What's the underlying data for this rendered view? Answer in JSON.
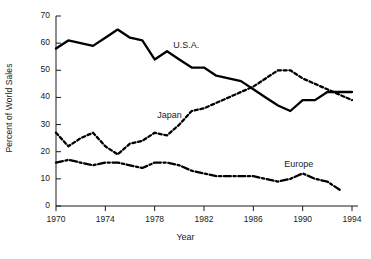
{
  "chart_data": {
    "type": "line",
    "title": "",
    "xlabel": "Year",
    "ylabel": "Percent of World Sales",
    "xlim": [
      1970,
      1994
    ],
    "ylim": [
      0,
      70
    ],
    "xticks": [
      1970,
      1974,
      1978,
      1982,
      1986,
      1990,
      1994
    ],
    "yticks": [
      0,
      10,
      20,
      30,
      40,
      50,
      60,
      70
    ],
    "grid": false,
    "legend_position": "inline-annotations",
    "x": [
      1970,
      1971,
      1972,
      1973,
      1974,
      1975,
      1976,
      1977,
      1978,
      1979,
      1980,
      1981,
      1982,
      1983,
      1984,
      1985,
      1986,
      1987,
      1988,
      1989,
      1990,
      1991,
      1992,
      1993,
      1994
    ],
    "series": [
      {
        "name": "U.S.A.",
        "style": "solid",
        "color": "#000000",
        "values": [
          58,
          61,
          60,
          59,
          62,
          65,
          62,
          61,
          54,
          57,
          54,
          51,
          51,
          48,
          47,
          46,
          43,
          40,
          37,
          35,
          39,
          39,
          42,
          42,
          42
        ]
      },
      {
        "name": "Japan",
        "style": "dotted",
        "color": "#000000",
        "values": [
          27,
          22,
          25,
          27,
          22,
          19,
          23,
          24,
          27,
          26,
          30,
          35,
          36,
          38,
          40,
          42,
          44,
          47,
          50,
          50,
          47,
          45,
          43,
          41,
          39
        ]
      },
      {
        "name": "Europe",
        "style": "dash-dot",
        "color": "#000000",
        "values": [
          16,
          17,
          16,
          15,
          16,
          16,
          15,
          14,
          16,
          16,
          15,
          13,
          12,
          11,
          11,
          11,
          11,
          10,
          9,
          10,
          12,
          10,
          9,
          6,
          null
        ]
      }
    ],
    "annotations": [
      {
        "text": "U.S.A.",
        "x": 1979.5,
        "y": 59
      },
      {
        "text": "Japan",
        "x": 1978.2,
        "y": 33
      },
      {
        "text": "Europe",
        "x": 1988.5,
        "y": 15
      }
    ]
  },
  "axis": {
    "y_tick_labels": [
      "70",
      "60",
      "50",
      "40",
      "30",
      "20",
      "10",
      "0"
    ],
    "x_tick_labels": [
      "1970",
      "1974",
      "1978",
      "1982",
      "1986",
      "1990",
      "1994"
    ],
    "y_title": "Percent of World Sales",
    "x_title": "Year"
  }
}
